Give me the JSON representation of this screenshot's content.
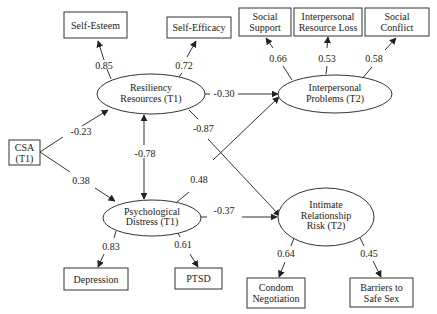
{
  "diagram": {
    "type": "structural-equation-model",
    "nodes": {
      "self_esteem": {
        "label": [
          "Self-Esteem"
        ],
        "shape": "box"
      },
      "self_efficacy": {
        "label": [
          "Self-Efficacy"
        ],
        "shape": "box"
      },
      "social_support": {
        "label": [
          "Social",
          "Support"
        ],
        "shape": "box"
      },
      "interpersonal_resource_loss": {
        "label": [
          "Interpersonal",
          "Resource Loss"
        ],
        "shape": "box"
      },
      "social_conflict": {
        "label": [
          "Social",
          "Conflict"
        ],
        "shape": "box"
      },
      "csa": {
        "label": [
          "CSA",
          "(T1)"
        ],
        "shape": "box"
      },
      "resiliency": {
        "label": [
          "Resiliency",
          "Resources (T1)"
        ],
        "shape": "ellipse"
      },
      "interpersonal_problems": {
        "label": [
          "Interpersonal",
          "Problems (T2)"
        ],
        "shape": "ellipse"
      },
      "psych_distress": {
        "label": [
          "Psychological",
          "Distress (T1)"
        ],
        "shape": "ellipse"
      },
      "intimate_risk": {
        "label": [
          "Intimate",
          "Relationship",
          "Risk (T2)"
        ],
        "shape": "ellipse"
      },
      "depression": {
        "label": [
          "Depression"
        ],
        "shape": "box"
      },
      "ptsd": {
        "label": [
          "PTSD"
        ],
        "shape": "box"
      },
      "condom_negotiation": {
        "label": [
          "Condom",
          "Negotiation"
        ],
        "shape": "box"
      },
      "barriers_safe_sex": {
        "label": [
          "Barriers to",
          "Safe Sex"
        ],
        "shape": "box"
      }
    },
    "edges": {
      "resiliency_self_esteem": {
        "from": "Resiliency Resources (T1)",
        "to": "Self-Esteem",
        "coef": "0.85"
      },
      "resiliency_self_efficacy": {
        "from": "Resiliency Resources (T1)",
        "to": "Self-Efficacy",
        "coef": "0.72"
      },
      "ip_social_support": {
        "from": "Interpersonal Problems (T2)",
        "to": "Social Support",
        "coef": "0.66"
      },
      "ip_resource_loss": {
        "from": "Interpersonal Problems (T2)",
        "to": "Interpersonal Resource Loss",
        "coef": "0.53"
      },
      "ip_social_conflict": {
        "from": "Interpersonal Problems (T2)",
        "to": "Social Conflict",
        "coef": "0.58"
      },
      "resiliency_ip": {
        "from": "Resiliency Resources (T1)",
        "to": "Interpersonal Problems (T2)",
        "coef": "-0.30"
      },
      "resiliency_intimate": {
        "from": "Resiliency Resources (T1)",
        "to": "Intimate Relationship Risk (T2)",
        "coef": "-0.87"
      },
      "csa_resiliency": {
        "from": "CSA (T1)",
        "to": "Resiliency Resources (T1)",
        "coef": "-0.23"
      },
      "csa_distress": {
        "from": "CSA (T1)",
        "to": "Psychological Distress (T1)",
        "coef": "0.38"
      },
      "resiliency_distress": {
        "from": "Resiliency Resources (T1)",
        "to": "Psychological Distress (T1)",
        "coef": "-0.78",
        "bidirectional": true
      },
      "distress_ip": {
        "from": "Psychological Distress (T1)",
        "to": "Interpersonal Problems (T2)",
        "coef": "0.48"
      },
      "distress_intimate": {
        "from": "Psychological Distress (T1)",
        "to": "Intimate Relationship Risk (T2)",
        "coef": "-0.37"
      },
      "distress_depression": {
        "from": "Psychological Distress (T1)",
        "to": "Depression",
        "coef": "0.83"
      },
      "distress_ptsd": {
        "from": "Psychological Distress (T1)",
        "to": "PTSD",
        "coef": "0.61"
      },
      "intimate_condom": {
        "from": "Intimate Relationship Risk (T2)",
        "to": "Condom Negotiation",
        "coef": "0.64"
      },
      "intimate_barriers": {
        "from": "Intimate Relationship Risk (T2)",
        "to": "Barriers to Safe Sex",
        "coef": "0.45"
      }
    },
    "colors": {
      "stroke": "#333333",
      "text": "#222222",
      "background": "#ffffff"
    }
  }
}
